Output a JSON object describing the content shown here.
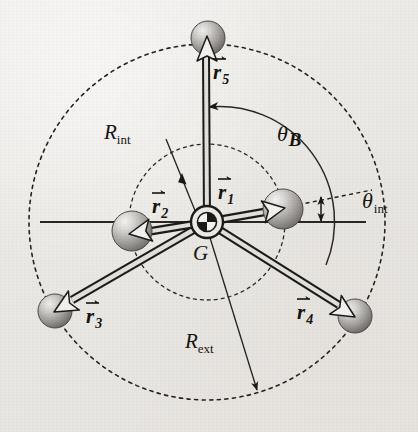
{
  "figure": {
    "type": "vector-diagram",
    "center_label": "G",
    "background_color": "#eceae7",
    "ink_color": "#1a1814"
  },
  "labels": {
    "center": "G",
    "r1": "r",
    "r1_sub": "1",
    "r2": "r",
    "r2_sub": "2",
    "r3": "r",
    "r3_sub": "3",
    "r4": "r",
    "r4_sub": "4",
    "r5": "r",
    "r5_sub": "5",
    "r_int": "R",
    "r_int_sub": "int",
    "r_ext": "R",
    "r_ext_sub": "ext",
    "theta_b": "θ",
    "theta_b_sub": "B",
    "theta_int": "θ",
    "theta_int_sub": "int"
  },
  "geometry": {
    "center": {
      "x": 207,
      "y": 222
    },
    "inner_radius": 78,
    "outer_radius": 178,
    "axis_line": {
      "x1": 40,
      "y1": 222,
      "x2": 366,
      "y2": 222
    },
    "theta_b_degrees": 90,
    "theta_int_degrees": 12
  },
  "vectors": [
    {
      "name": "r1",
      "angle_deg": 12,
      "length": 78,
      "ring": "inner",
      "label_x": 222,
      "label_y": 178
    },
    {
      "name": "r2",
      "angle_deg": 186,
      "length": 78,
      "ring": "inner",
      "label_x": 152,
      "label_y": 186
    },
    {
      "name": "r3",
      "angle_deg": 215,
      "length": 178,
      "ring": "outer",
      "label_x": 82,
      "label_y": 302
    },
    {
      "name": "r4",
      "angle_deg": 327,
      "length": 178,
      "ring": "outer",
      "label_x": 294,
      "label_y": 298
    },
    {
      "name": "r5",
      "angle_deg": 91,
      "length": 178,
      "ring": "outer",
      "label_x": 216,
      "label_y": 60
    }
  ],
  "spheres": [
    {
      "for": "r1",
      "cx": 283,
      "cy": 209,
      "r": 20
    },
    {
      "for": "r2",
      "cx": 132,
      "cy": 231,
      "r": 20
    },
    {
      "for": "r3",
      "cx": 55,
      "cy": 311,
      "r": 17
    },
    {
      "for": "r4",
      "cx": 355,
      "cy": 316,
      "r": 17
    },
    {
      "for": "r5",
      "cx": 208,
      "cy": 38,
      "r": 17
    }
  ],
  "annotations": {
    "r_int_leader": {
      "from_x": 168,
      "from_y": 140,
      "to_x": 192,
      "to_y": 200
    },
    "r_ext_leader": {
      "from_x": 207,
      "from_y": 226,
      "to_x": 258,
      "to_y": 393
    },
    "theta_b_arc_radius": 115,
    "theta_int_tick_x": 321
  }
}
